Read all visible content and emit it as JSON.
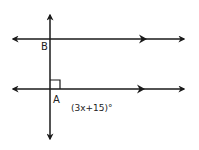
{
  "diagram": {
    "type": "geometry",
    "stroke_color": "#1a1a1a",
    "points": {
      "B": {
        "label": "B"
      },
      "A": {
        "label": "A"
      }
    },
    "angle_label": "(3x+15)°",
    "right_angle_marker": true,
    "parallel_markers": "double arrowheads on each horizontal line"
  }
}
